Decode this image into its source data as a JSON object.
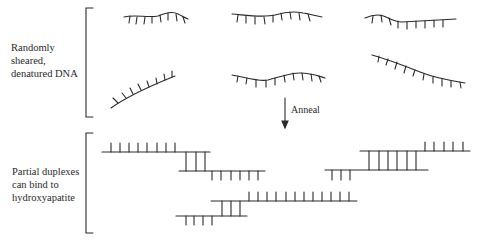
{
  "diagram": {
    "type": "process-schematic",
    "sections": [
      {
        "id": "denatured",
        "label_lines": [
          "Randomly",
          "sheared,",
          "denatured DNA"
        ],
        "content": "Six single-stranded DNA fragments drawn as wavy backbones with base ticks"
      },
      {
        "id": "step",
        "arrow_label": "Anneal"
      },
      {
        "id": "duplexes",
        "label_lines": [
          "Partial duplexes",
          "can bind to",
          "hydroxyapatite"
        ],
        "content": "Three partial duplex structures formed by overlapping single strands joined by base-pair rungs"
      }
    ],
    "colors": {
      "ink": "#2a2a2a",
      "background": "#ffffff"
    }
  }
}
